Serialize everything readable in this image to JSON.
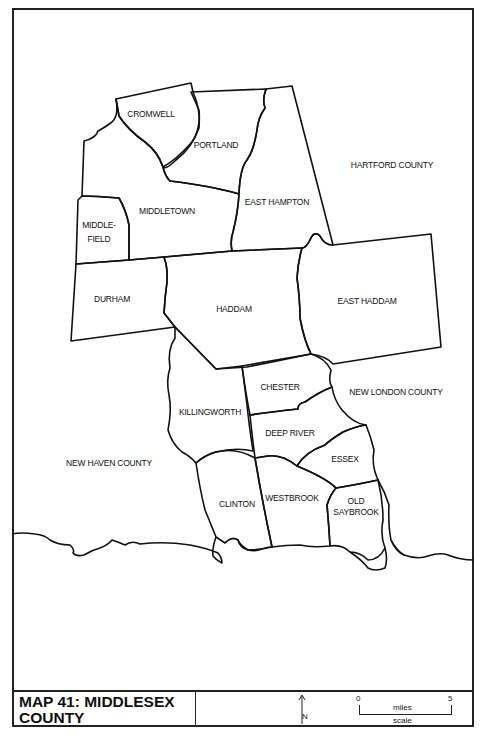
{
  "map": {
    "title": "MAP 41: MIDDLESEX COUNTY",
    "title_line1": "MAP 41:  MIDDLESEX",
    "title_line2": "COUNTY",
    "towns": {
      "cromwell": "CROMWELL",
      "portland": "PORTLAND",
      "middletown": "MIDDLETOWN",
      "middlefield_1": "MIDDLE-",
      "middlefield_2": "FIELD",
      "east_hampton": "EAST HAMPTON",
      "durham": "DURHAM",
      "haddam": "HADDAM",
      "east_haddam": "EAST HADDAM",
      "chester": "CHESTER",
      "killingworth": "KILLINGWORTH",
      "deep_river": "DEEP RIVER",
      "essex": "ESSEX",
      "clinton": "CLINTON",
      "westbrook": "WESTBROOK",
      "old_saybrook_1": "OLD",
      "old_saybrook_2": "SAYBROOK"
    },
    "counties": {
      "hartford": "HARTFORD COUNTY",
      "new_haven": "NEW HAVEN COUNTY",
      "new_london": "NEW LONDON COUNTY"
    },
    "legend": {
      "north_label": "N",
      "north_icon": "north-arrow-icon",
      "scale_min": "0",
      "scale_max": "5",
      "scale_unit": "miles",
      "scale_caption": "scale"
    }
  }
}
